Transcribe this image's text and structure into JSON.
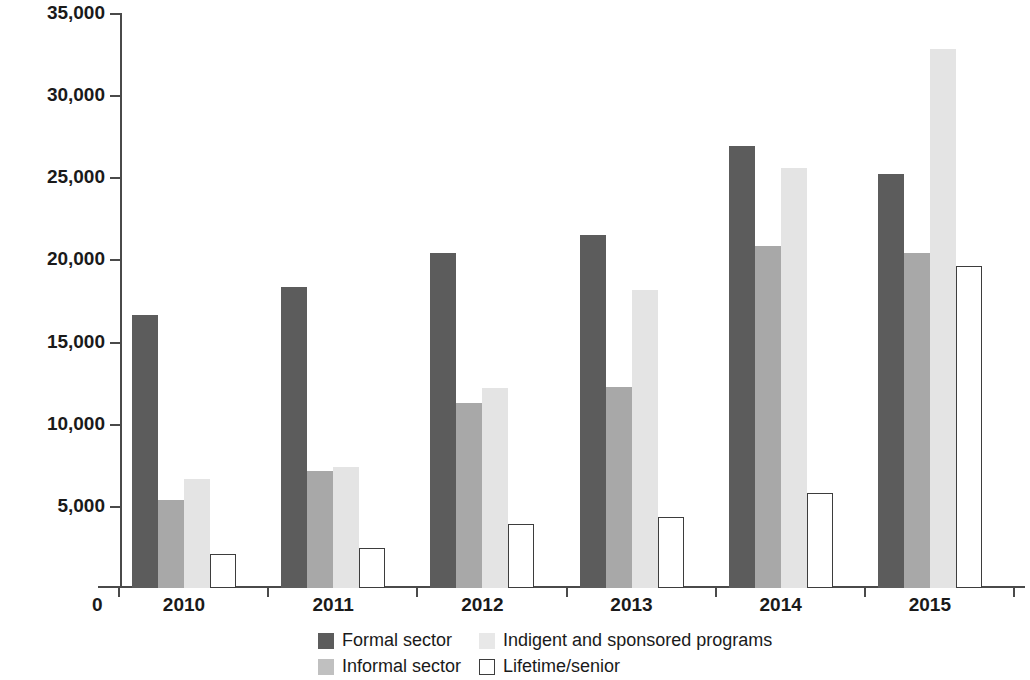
{
  "chart_data": {
    "type": "bar",
    "title": "",
    "xlabel": "",
    "ylabel": "₱, millions",
    "ylim": [
      0,
      35000
    ],
    "ytick_values": [
      0,
      5000,
      10000,
      15000,
      20000,
      25000,
      30000,
      35000
    ],
    "ytick_labels": [
      "0",
      "5,000",
      "10,000",
      "15,000",
      "20,000",
      "25,000",
      "30,000",
      "35,000"
    ],
    "grid": false,
    "legend_position": "bottom",
    "categories": [
      "2010",
      "2011",
      "2012",
      "2013",
      "2014",
      "2015"
    ],
    "series": [
      {
        "name": "Formal sector",
        "color": "#5c5c5c",
        "values": [
          16600,
          18300,
          20400,
          21500,
          26900,
          25200
        ]
      },
      {
        "name": "Informal sector",
        "color": "#a8a8a8",
        "values": [
          5350,
          7100,
          11250,
          12250,
          20800,
          20400
        ]
      },
      {
        "name": "Indigent and sponsored programs",
        "color": "#e4e4e4",
        "values": [
          6650,
          7350,
          12200,
          18150,
          25550,
          32800
        ]
      },
      {
        "name": "Lifetime/senior",
        "color": "#ffffff",
        "values": [
          2100,
          2450,
          3900,
          4350,
          5800,
          19600
        ]
      }
    ]
  },
  "legend": {
    "items": [
      {
        "label": "Formal sector",
        "key": "formal"
      },
      {
        "label": "Indigent and sponsored programs",
        "key": "indigent"
      },
      {
        "label": "Informal sector",
        "key": "informal"
      },
      {
        "label": "Lifetime/senior",
        "key": "lifetime"
      }
    ]
  },
  "axis": {
    "zero_label": "0"
  }
}
